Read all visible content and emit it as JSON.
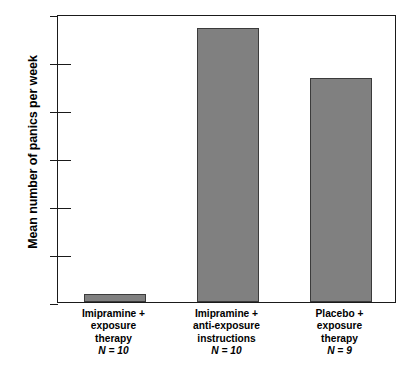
{
  "chart_data": {
    "type": "bar",
    "title": "",
    "xlabel": "",
    "ylabel": "Mean number of panics per week",
    "ylim": [
      0,
      3
    ],
    "ytick_values": [
      0,
      0.5,
      1,
      1.5,
      2,
      2.5,
      3
    ],
    "ytick_labels": [
      "0",
      "0.5",
      "1",
      "1.5",
      "2",
      "2.5",
      "3"
    ],
    "grid": false,
    "legend": false,
    "bar_color": "#808080",
    "bar_edge_color": "#3b3b3b",
    "axis_color": "#1a1a1a",
    "categories": [
      "Imipramine +\nexposure\ntherapy",
      "Imipramine +\nanti-exposure\ninstructions",
      "Placebo +\nexposure\ntherapy"
    ],
    "category_n": [
      "N = 10",
      "N = 10",
      "N = 9"
    ],
    "values": [
      0.08,
      2.85,
      2.33
    ]
  }
}
